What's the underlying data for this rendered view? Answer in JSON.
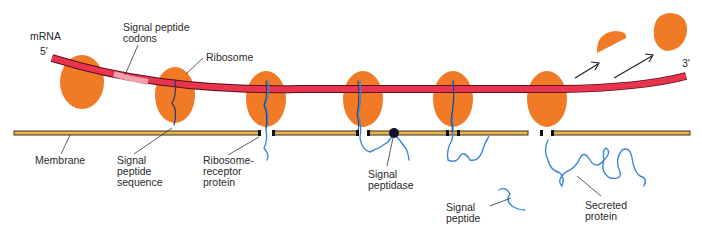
{
  "diagram": {
    "labels": {
      "mrna": "mRNA",
      "five_prime": "5′",
      "three_prime": "3′",
      "signal_peptide_codons": "Signal peptide\ncodons",
      "ribosome": "Ribosome",
      "membrane": "Membrane",
      "signal_peptide_sequence": "Signal\npeptide\nsequence",
      "ribosome_receptor_protein": "Ribosome-\nreceptor\nprotein",
      "signal_peptidase": "Signal\npeptidase",
      "signal_peptide": "Signal\npeptide",
      "secreted_protein": "Secreted\nprotein"
    },
    "colors": {
      "ribosome": "#f07a26",
      "mrna": "#e8344c",
      "mrna_outline": "#5a1020",
      "signal_codons": "#f2a0aa",
      "membrane_fill": "#e8b84a",
      "membrane_edge": "#3a3020",
      "polypeptide": "#3a86d8",
      "peptidase": "#101030",
      "leader_line": "#333333"
    },
    "ribosome_count_on_mrna": 7,
    "released_subunits": 2
  }
}
